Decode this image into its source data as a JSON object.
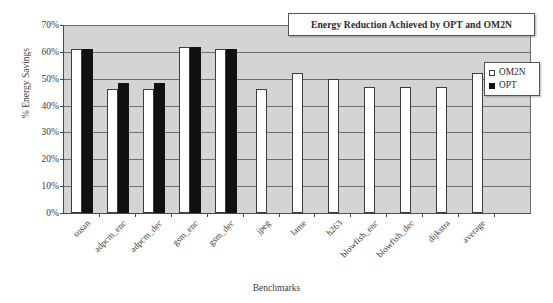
{
  "chart_data": {
    "type": "bar",
    "title": "Energy Reduction Achieved by OPT and OM2N",
    "xlabel": "Benchmarks",
    "ylabel": "% Energy Savings",
    "ylim": [
      0,
      70
    ],
    "ytick_labels": [
      "70%",
      "60%",
      "50%",
      "40%",
      "30%",
      "20%",
      "10%",
      "0%"
    ],
    "ytick_values": [
      70,
      60,
      50,
      40,
      30,
      20,
      10,
      0
    ],
    "grid": "horizontal",
    "legend_position": "top-right-inside",
    "categories": [
      "susan",
      "adpcm_enc",
      "adpcm_dec",
      "gsm_enc",
      "gsm_dec",
      "jpeg",
      "lame",
      "h263",
      "blowfish_enc",
      "blowfish_dec",
      "dijkstra",
      "average"
    ],
    "series": [
      {
        "name": "OM2N",
        "color": "#ffffff",
        "values": [
          61,
          46,
          46,
          62,
          61,
          46,
          52,
          50,
          47,
          47,
          47,
          52
        ]
      },
      {
        "name": "OPT",
        "color": "#111111",
        "values": [
          61,
          48.5,
          48.5,
          62,
          61,
          null,
          null,
          null,
          null,
          null,
          null,
          null
        ]
      }
    ]
  },
  "legend": {
    "entries": [
      {
        "label": "OM2N",
        "swatch": "hollow-square-icon"
      },
      {
        "label": "OPT",
        "swatch": "filled-square-icon"
      }
    ]
  },
  "colors": {
    "plot_background": "#d4d4d4",
    "gridline": "#6f6f6f",
    "axis": "#4a4a4a",
    "om2n_bar": "#ffffff",
    "opt_bar": "#111111",
    "page_background": "#ffffff"
  }
}
